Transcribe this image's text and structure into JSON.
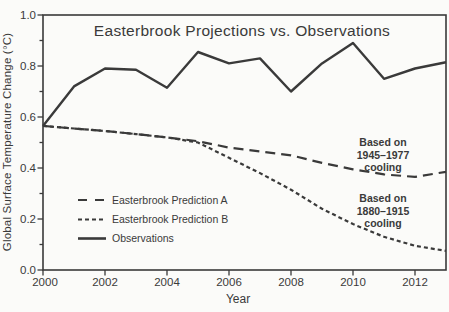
{
  "colors": {
    "ink": "#3a3a3a",
    "background": "#fbfbf9"
  },
  "chart_data": {
    "type": "line",
    "title": "Easterbrook Projections vs. Observations",
    "xlabel": "Year",
    "ylabel": "Global Surface Temperature Change (°C)",
    "xlim": [
      2000,
      2013
    ],
    "ylim": [
      0.0,
      1.0
    ],
    "grid": false,
    "legend_position": "lower-left-inside",
    "x_tick_labels": [
      "2000",
      "2002",
      "2004",
      "2006",
      "2008",
      "2010",
      "2012"
    ],
    "y_tick_labels": [
      "0.0",
      "0.2",
      "0.4",
      "0.6",
      "0.8",
      "1.0"
    ],
    "x": [
      2000,
      2001,
      2002,
      2003,
      2004,
      2005,
      2006,
      2007,
      2008,
      2009,
      2010,
      2011,
      2012,
      2013
    ],
    "series": [
      {
        "name": "Easterbrook Prediction A",
        "line_style": "long-dash",
        "values": [
          0.565,
          0.555,
          0.545,
          0.533,
          0.52,
          0.505,
          0.48,
          0.465,
          0.45,
          0.42,
          0.395,
          0.375,
          0.365,
          0.385
        ]
      },
      {
        "name": "Easterbrook Prediction B",
        "line_style": "short-dash",
        "values": [
          0.565,
          0.555,
          0.545,
          0.533,
          0.52,
          0.5,
          0.44,
          0.38,
          0.315,
          0.24,
          0.18,
          0.13,
          0.095,
          0.075
        ]
      },
      {
        "name": "Observations",
        "line_style": "solid",
        "values": [
          0.565,
          0.72,
          0.79,
          0.785,
          0.715,
          0.855,
          0.81,
          0.83,
          0.7,
          0.81,
          0.89,
          0.75,
          0.79,
          0.815
        ]
      }
    ],
    "annotations": [
      {
        "lines": [
          "Based on",
          "1945–1977",
          "cooling"
        ],
        "anchor_series": "Easterbrook Prediction A"
      },
      {
        "lines": [
          "Based on",
          "1880–1915",
          "cooling"
        ],
        "anchor_series": "Easterbrook Prediction B"
      }
    ]
  }
}
